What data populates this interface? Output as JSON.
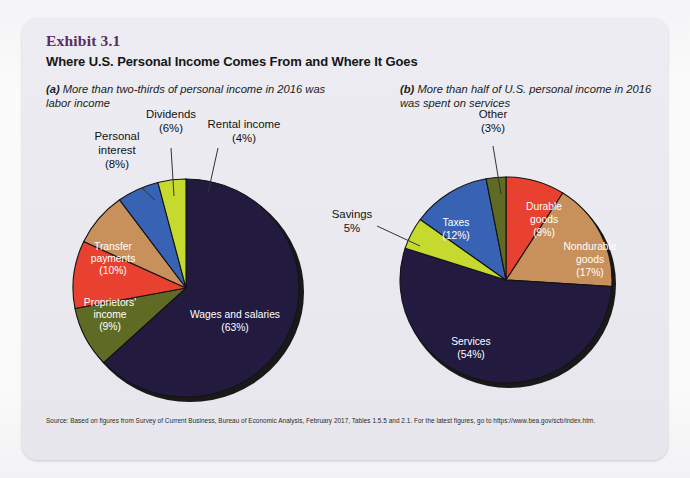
{
  "exhibit": {
    "number": "Exhibit 3.1",
    "title": "Where U.S. Personal Income Comes From and Where It Goes",
    "panel_a_label": "(a)",
    "panel_a_subtitle": "More than two-thirds of personal income in 2016 was labor income",
    "panel_b_label": "(b)",
    "panel_b_subtitle": "More than half of U.S. personal income in 2016 was spent on services",
    "source": "Source: Based on figures from Survey of Current Business, Bureau of Economic Analysis, February 2017, Tables 1.5.5 and 2.1. For the latest figures, go to https://www.bea.gov/scb/index.htm."
  },
  "colors": {
    "navy": "#221a3f",
    "olive": "#5f6b25",
    "red": "#e8412f",
    "tan": "#c8915c",
    "blue": "#3862b4",
    "yellowgreen": "#c5d92e",
    "card_bg": "#e9e9ef",
    "title_purple": "#5b2b62",
    "edge": "#1d1d1d"
  },
  "chart_data": [
    {
      "type": "pie",
      "id": "personal-income-sources",
      "title": "More than two-thirds of personal income in 2016 was labor income",
      "panel": "(a)",
      "start_angle_deg": 0,
      "direction": "clockwise",
      "labels": [
        "Wages and salaries",
        "Proprietors' income",
        "Transfer payments",
        "Personal interest",
        "Dividends",
        "Rental income"
      ],
      "values": [
        63,
        9,
        10,
        8,
        6,
        4
      ],
      "value_suffix": "%",
      "slice_labels": [
        "Wages and salaries\n(63%)",
        "Proprietors'\nincome\n(9%)",
        "Transfer\npayments\n(10%)",
        "Personal\ninterest\n(8%)",
        "Dividends\n(6%)",
        "Rental income\n(4%)"
      ],
      "colors": [
        "#221a3f",
        "#5f6b25",
        "#e8412f",
        "#c8915c",
        "#3862b4",
        "#c5d92e"
      ],
      "label_placement": [
        "inside",
        "inside",
        "inside",
        "outside",
        "outside",
        "outside"
      ],
      "legend": "none"
    },
    {
      "type": "pie",
      "id": "personal-income-uses",
      "title": "More than half of U.S. personal income in 2016 was spent on services",
      "panel": "(b)",
      "start_angle_deg": 0,
      "direction": "clockwise",
      "labels": [
        "Durable goods",
        "Nondurable goods",
        "Services",
        "Savings",
        "Taxes",
        "Other"
      ],
      "values": [
        9,
        17,
        54,
        5,
        12,
        3
      ],
      "value_suffix": "%",
      "slice_labels": [
        "Durable\ngoods\n(9%)",
        "Nondurable\ngoods\n(17%)",
        "Services\n(54%)",
        "Savings\n5%",
        "Taxes\n(12%)",
        "Other\n(3%)"
      ],
      "colors": [
        "#e8412f",
        "#c8915c",
        "#221a3f",
        "#c5d92e",
        "#3862b4",
        "#5f6b25"
      ],
      "label_placement": [
        "inside",
        "inside",
        "inside",
        "outside",
        "inside",
        "outside"
      ],
      "legend": "none"
    }
  ],
  "pie_a_labels": {
    "wages": "Wages and salaries",
    "wages_pct": "(63%)",
    "proprietors_1": "Proprietors'",
    "proprietors_2": "income",
    "proprietors_pct": "(9%)",
    "transfer_1": "Transfer",
    "transfer_2": "payments",
    "transfer_pct": "(10%)",
    "interest_1": "Personal",
    "interest_2": "interest",
    "interest_pct": "(8%)",
    "dividends": "Dividends",
    "dividends_pct": "(6%)",
    "rental": "Rental income",
    "rental_pct": "(4%)"
  },
  "pie_b_labels": {
    "durable_1": "Durable",
    "durable_2": "goods",
    "durable_pct": "(9%)",
    "nondurable_1": "Nondurable",
    "nondurable_2": "goods",
    "nondurable_pct": "(17%)",
    "services": "Services",
    "services_pct": "(54%)",
    "savings": "Savings",
    "savings_pct": "5%",
    "taxes": "Taxes",
    "taxes_pct": "(12%)",
    "other": "Other",
    "other_pct": "(3%)"
  }
}
